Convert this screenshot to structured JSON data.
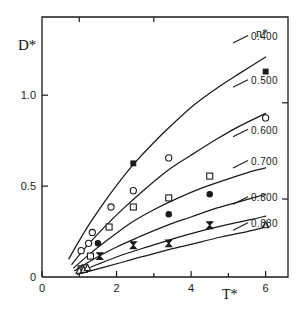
{
  "chart_data": {
    "type": "scatter",
    "title": "",
    "xlabel": "T*",
    "ylabel": "D*",
    "xlim": [
      0,
      6.6
    ],
    "ylim": [
      0,
      1.43
    ],
    "grid": false,
    "legend_position": "right-inside",
    "legend_title": "n*",
    "xticks": [
      0,
      2,
      4,
      6
    ],
    "xticklabels": [
      "0",
      "2",
      "4",
      "6"
    ],
    "xminorticks": [
      1,
      3,
      5
    ],
    "yticks": [
      0,
      0.5,
      1.0
    ],
    "yticklabels": [
      "0",
      "0.5",
      "1.0"
    ],
    "series": [
      {
        "name": "0.400",
        "label": "0.400",
        "marker": "filled-square",
        "curve": [
          {
            "x": 0.72,
            "y": 0.1
          },
          {
            "x": 1.0,
            "y": 0.2
          },
          {
            "x": 1.3,
            "y": 0.3
          },
          {
            "x": 1.7,
            "y": 0.42
          },
          {
            "x": 2.1,
            "y": 0.53
          },
          {
            "x": 2.5,
            "y": 0.63
          },
          {
            "x": 3.0,
            "y": 0.74
          },
          {
            "x": 3.5,
            "y": 0.84
          },
          {
            "x": 4.1,
            "y": 0.95
          },
          {
            "x": 4.7,
            "y": 1.04
          },
          {
            "x": 5.3,
            "y": 1.12
          },
          {
            "x": 6.0,
            "y": 1.21
          }
        ],
        "points": [
          {
            "x": 2.45,
            "y": 0.625
          },
          {
            "x": 6.0,
            "y": 1.13
          }
        ]
      },
      {
        "name": "0.500",
        "label": "0.500",
        "marker": "open-circle",
        "curve": [
          {
            "x": 0.8,
            "y": 0.07
          },
          {
            "x": 1.2,
            "y": 0.17
          },
          {
            "x": 1.7,
            "y": 0.28
          },
          {
            "x": 2.2,
            "y": 0.38
          },
          {
            "x": 2.8,
            "y": 0.49
          },
          {
            "x": 3.4,
            "y": 0.59
          },
          {
            "x": 4.0,
            "y": 0.67
          },
          {
            "x": 4.7,
            "y": 0.76
          },
          {
            "x": 5.3,
            "y": 0.83
          },
          {
            "x": 6.0,
            "y": 0.9
          }
        ],
        "points": [
          {
            "x": 1.05,
            "y": 0.145
          },
          {
            "x": 1.25,
            "y": 0.185
          },
          {
            "x": 1.35,
            "y": 0.245
          },
          {
            "x": 1.85,
            "y": 0.385
          },
          {
            "x": 2.45,
            "y": 0.475
          },
          {
            "x": 3.4,
            "y": 0.655
          },
          {
            "x": 6.0,
            "y": 0.875
          }
        ]
      },
      {
        "name": "0.600",
        "label": "0.600",
        "marker": "open-square",
        "curve": [
          {
            "x": 0.85,
            "y": 0.05
          },
          {
            "x": 1.3,
            "y": 0.13
          },
          {
            "x": 1.8,
            "y": 0.21
          },
          {
            "x": 2.4,
            "y": 0.3
          },
          {
            "x": 3.0,
            "y": 0.37
          },
          {
            "x": 3.6,
            "y": 0.43
          },
          {
            "x": 4.3,
            "y": 0.49
          },
          {
            "x": 5.0,
            "y": 0.54
          },
          {
            "x": 5.6,
            "y": 0.58
          },
          {
            "x": 6.0,
            "y": 0.6
          }
        ],
        "points": [
          {
            "x": 1.05,
            "y": 0.045
          },
          {
            "x": 1.15,
            "y": 0.05
          },
          {
            "x": 1.3,
            "y": 0.115
          },
          {
            "x": 1.8,
            "y": 0.275
          },
          {
            "x": 2.45,
            "y": 0.385
          },
          {
            "x": 3.4,
            "y": 0.435
          },
          {
            "x": 4.5,
            "y": 0.555
          }
        ]
      },
      {
        "name": "0.700",
        "label": "0.700",
        "marker": "filled-circle",
        "curve": [
          {
            "x": 0.88,
            "y": 0.035
          },
          {
            "x": 1.4,
            "y": 0.1
          },
          {
            "x": 2.0,
            "y": 0.165
          },
          {
            "x": 2.6,
            "y": 0.22
          },
          {
            "x": 3.3,
            "y": 0.28
          },
          {
            "x": 4.0,
            "y": 0.33
          },
          {
            "x": 4.7,
            "y": 0.38
          },
          {
            "x": 5.4,
            "y": 0.42
          },
          {
            "x": 6.0,
            "y": 0.455
          }
        ],
        "points": [
          {
            "x": 1.5,
            "y": 0.185
          },
          {
            "x": 3.4,
            "y": 0.345
          },
          {
            "x": 4.5,
            "y": 0.455
          }
        ]
      },
      {
        "name": "0.800",
        "label": "0.800",
        "marker": "bowtie",
        "curve": [
          {
            "x": 0.92,
            "y": 0.02
          },
          {
            "x": 1.5,
            "y": 0.07
          },
          {
            "x": 2.2,
            "y": 0.125
          },
          {
            "x": 2.9,
            "y": 0.17
          },
          {
            "x": 3.6,
            "y": 0.215
          },
          {
            "x": 4.3,
            "y": 0.255
          },
          {
            "x": 5.0,
            "y": 0.29
          },
          {
            "x": 5.6,
            "y": 0.315
          },
          {
            "x": 6.0,
            "y": 0.335
          }
        ],
        "points": [
          {
            "x": 1.55,
            "y": 0.115
          },
          {
            "x": 2.45,
            "y": 0.175
          },
          {
            "x": 3.4,
            "y": 0.185
          },
          {
            "x": 4.5,
            "y": 0.285
          }
        ]
      },
      {
        "name": "0.880",
        "label": "0.880",
        "marker": "open-triangle",
        "curve": [
          {
            "x": 0.95,
            "y": 0.015
          },
          {
            "x": 1.6,
            "y": 0.05
          },
          {
            "x": 2.4,
            "y": 0.095
          },
          {
            "x": 3.2,
            "y": 0.14
          },
          {
            "x": 4.0,
            "y": 0.18
          },
          {
            "x": 4.8,
            "y": 0.22
          },
          {
            "x": 5.5,
            "y": 0.25
          },
          {
            "x": 6.0,
            "y": 0.275
          }
        ],
        "points": [
          {
            "x": 1.0,
            "y": 0.035
          },
          {
            "x": 1.12,
            "y": 0.04
          },
          {
            "x": 1.22,
            "y": 0.05
          },
          {
            "x": 6.0,
            "y": 0.285
          }
        ]
      }
    ]
  },
  "axis": {
    "ylabel": "D*",
    "xlabel": "T*",
    "yticklabels": [
      "1.0",
      "0.5",
      "0"
    ],
    "xticklabels": [
      "0",
      "2",
      "4",
      "6"
    ]
  },
  "legend": {
    "title": "n*",
    "entries": [
      "0.400",
      "0.500",
      "0.600",
      "0.700",
      "0.800",
      "0.880"
    ]
  },
  "style": {
    "line_color": "#1a1a1a",
    "axis_color": "#1a1a1a",
    "background": "#ffffff"
  }
}
